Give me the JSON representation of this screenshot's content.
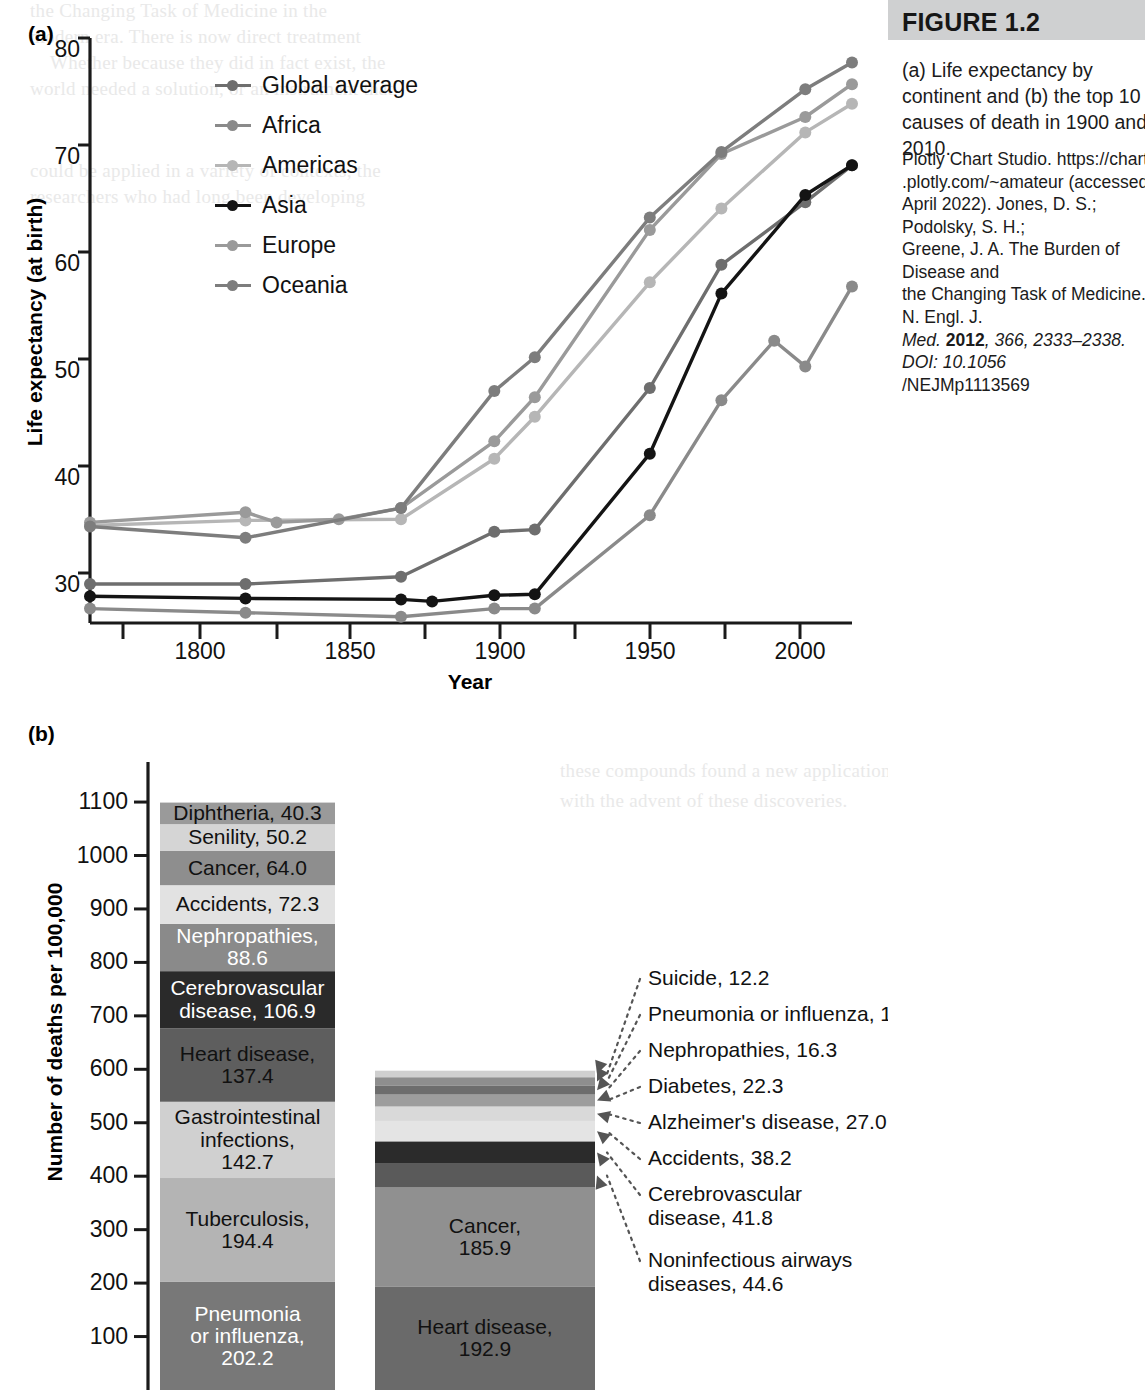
{
  "sidebar": {
    "figure_label": "FIGURE 1.2",
    "caption": "(a) Life expectancy by continent and (b) the top 10 causes of death in 1900 and 2010.",
    "source_line1": "Plotly Chart Studio. https://chart",
    "source_line2": ".plotly.com/~amateur (accessed",
    "source_line3": "April 2022). Jones, D. S.; Podolsky, S. H.;",
    "source_line4": "Greene, J. A. The Burden of Disease and",
    "source_line5": "the Changing Task of Medicine. N. Engl. J.",
    "source_line6_italic": "Med.",
    "source_line6_year": "2012",
    "source_line6_rest": ", 366, 2333–2338. DOI: 10.1056",
    "source_line7": "/NEJMp1113569"
  },
  "panel_a": {
    "tag": "(a)",
    "ylabel": "Life expectancy (at birth)",
    "xlabel": "Year",
    "yticks": [
      "80",
      "70",
      "60",
      "50",
      "40",
      "30"
    ],
    "xticks": [
      "1800",
      "1850",
      "1900",
      "1950",
      "2000"
    ],
    "legend": [
      {
        "label": "Global average",
        "color": "#6e6e6e"
      },
      {
        "label": "Africa",
        "color": "#8a8a8a"
      },
      {
        "label": "Americas",
        "color": "#b6b6b6"
      },
      {
        "label": "Asia",
        "color": "#141414"
      },
      {
        "label": "Europe",
        "color": "#9a9a9a"
      },
      {
        "label": "Oceania",
        "color": "#7d7d7d"
      }
    ]
  },
  "panel_b": {
    "tag": "(b)",
    "ylabel": "Number of deaths per 100,000",
    "yticks": [
      "1100",
      "1000",
      "900",
      "800",
      "700",
      "600",
      "500",
      "400",
      "300",
      "200",
      "100"
    ],
    "bar1900_segments": [
      {
        "label": "Diphtheria, 40.3",
        "value": 40.3,
        "color": "#9a9a9a",
        "text_color": "#111111"
      },
      {
        "label": "Senility, 50.2",
        "value": 50.2,
        "color": "#d5d5d5",
        "text_color": "#111111"
      },
      {
        "label": "Cancer, 64.0",
        "value": 64.0,
        "color": "#8e8e8e",
        "text_color": "#111111"
      },
      {
        "label": "Accidents, 72.3",
        "value": 72.3,
        "color": "#e2e2e2",
        "text_color": "#111111"
      },
      {
        "label": "Nephropathies, 88.6",
        "value": 88.6,
        "color": "#8a8a8a",
        "text_color": "#ffffff"
      },
      {
        "label": "Cerebrovascular\ndisease, 106.9",
        "value": 106.9,
        "color": "#2a2a2a",
        "text_color": "#ffffff"
      },
      {
        "label": "Heart disease,\n137.4",
        "value": 137.4,
        "color": "#5e5e5e",
        "text_color": "#111111"
      },
      {
        "label": "Gastrointestinal\ninfections,\n142.7",
        "value": 142.7,
        "color": "#d0d0d0",
        "text_color": "#111111"
      },
      {
        "label": "Tuberculosis,\n194.4",
        "value": 194.4,
        "color": "#b4b4b4",
        "text_color": "#111111"
      },
      {
        "label": "Pneumonia\nor influenza,\n202.2",
        "value": 202.2,
        "color": "#787878",
        "text_color": "#ffffff"
      }
    ],
    "bar2010_segments": [
      {
        "label": "Suicide, 12.2",
        "value": 12.2,
        "color": "#cfcfcf"
      },
      {
        "label": "Pneumonia or influenza, 16.2",
        "value": 16.2,
        "color": "#8e8e8e"
      },
      {
        "label": "Nephropathies, 16.3",
        "value": 16.3,
        "color": "#6d6d6d"
      },
      {
        "label": "Diabetes, 22.3",
        "value": 22.3,
        "color": "#9d9d9d"
      },
      {
        "label": "Alzheimer's disease, 27.0",
        "value": 27.0,
        "color": "#d9d9d9"
      },
      {
        "label": "Accidents, 38.2",
        "value": 38.2,
        "color": "#e4e4e4"
      },
      {
        "label": "Cerebrovascular\ndisease, 41.8",
        "value": 41.8,
        "color": "#2b2b2b"
      },
      {
        "label": "Noninfectious airways\ndiseases, 44.6",
        "value": 44.6,
        "color": "#5a5a5a"
      },
      {
        "label": "Cancer,\n185.9",
        "value": 185.9,
        "color": "#909090",
        "text_color": "#111111"
      },
      {
        "label": "Heart disease,\n192.9",
        "value": 192.9,
        "color": "#6a6a6a",
        "text_color": "#111111"
      }
    ]
  },
  "chart_data": [
    {
      "type": "line",
      "title": "(a) Life expectancy by continent",
      "xlabel": "Year",
      "ylabel": "Life expectancy (at birth)",
      "xlim": [
        1770,
        2015
      ],
      "ylim": [
        25,
        82
      ],
      "xticks": [
        1800,
        1850,
        1900,
        1950,
        2000
      ],
      "yticks": [
        30,
        40,
        50,
        60,
        70,
        80
      ],
      "grid": false,
      "legend_position": "top-left-inside",
      "series": [
        {
          "name": "Global average",
          "color": "#6e6e6e",
          "x": [
            1770,
            1820,
            1870,
            1900,
            1913,
            1950,
            1973,
            2000,
            2015
          ],
          "y": [
            28.8,
            28.8,
            29.5,
            33.9,
            34.1,
            47.9,
            59.9,
            66.0,
            69.6
          ]
        },
        {
          "name": "Africa",
          "color": "#8a8a8a",
          "x": [
            1770,
            1820,
            1870,
            1900,
            1913,
            1950,
            1973,
            1990,
            2000,
            2015
          ],
          "y": [
            26.4,
            26.0,
            25.6,
            26.4,
            26.4,
            35.5,
            46.7,
            52.5,
            50.0,
            57.8
          ]
        },
        {
          "name": "Americas",
          "color": "#b6b6b6",
          "x": [
            1770,
            1820,
            1870,
            1900,
            1913,
            1950,
            1973,
            2000,
            2015
          ],
          "y": [
            34.5,
            35.0,
            35.1,
            41.0,
            45.1,
            58.2,
            65.4,
            72.8,
            75.6
          ]
        },
        {
          "name": "Asia",
          "color": "#141414",
          "x": [
            1770,
            1820,
            1870,
            1880,
            1900,
            1913,
            1950,
            1973,
            2000,
            2015
          ],
          "y": [
            27.6,
            27.4,
            27.3,
            27.1,
            27.7,
            27.8,
            41.5,
            57.1,
            66.7,
            69.6
          ]
        },
        {
          "name": "Europe",
          "color": "#9a9a9a",
          "x": [
            1770,
            1820,
            1830,
            1850,
            1870,
            1900,
            1913,
            1950,
            1973,
            2000,
            2015
          ],
          "y": [
            34.8,
            35.8,
            34.8,
            35.1,
            36.2,
            42.7,
            47.0,
            63.3,
            70.7,
            74.3,
            77.5
          ]
        },
        {
          "name": "Oceania",
          "color": "#7d7d7d",
          "x": [
            1770,
            1820,
            1870,
            1900,
            1913,
            1950,
            1973,
            2000,
            2015
          ],
          "y": [
            34.4,
            33.3,
            36.2,
            47.6,
            50.9,
            64.5,
            70.9,
            77.0,
            79.6
          ]
        }
      ]
    },
    {
      "type": "bar",
      "title": "(b) Top 10 causes of death in 1900 and 2010",
      "ylabel": "Number of deaths per 100,000",
      "ylim": [
        0,
        1130
      ],
      "yticks": [
        100,
        200,
        300,
        400,
        500,
        600,
        700,
        800,
        900,
        1000,
        1100
      ],
      "stacked": true,
      "categories": [
        "1900",
        "2010"
      ],
      "series": [
        {
          "name": "1900",
          "total": 1099.1,
          "segments": [
            {
              "label": "Pneumonia or influenza",
              "value": 202.2
            },
            {
              "label": "Tuberculosis",
              "value": 194.4
            },
            {
              "label": "Gastrointestinal infections",
              "value": 142.7
            },
            {
              "label": "Heart disease",
              "value": 137.4
            },
            {
              "label": "Cerebrovascular disease",
              "value": 106.9
            },
            {
              "label": "Nephropathies",
              "value": 88.6
            },
            {
              "label": "Accidents",
              "value": 72.3
            },
            {
              "label": "Cancer",
              "value": 64.0
            },
            {
              "label": "Senility",
              "value": 50.2
            },
            {
              "label": "Diphtheria",
              "value": 40.3
            }
          ]
        },
        {
          "name": "2010",
          "total": 597.5,
          "segments": [
            {
              "label": "Heart disease",
              "value": 192.9
            },
            {
              "label": "Cancer",
              "value": 185.9
            },
            {
              "label": "Noninfectious airways diseases",
              "value": 44.6
            },
            {
              "label": "Cerebrovascular disease",
              "value": 41.8
            },
            {
              "label": "Accidents",
              "value": 38.2
            },
            {
              "label": "Alzheimer's disease",
              "value": 27.0
            },
            {
              "label": "Diabetes",
              "value": 22.3
            },
            {
              "label": "Nephropathies",
              "value": 16.3
            },
            {
              "label": "Pneumonia or influenza",
              "value": 16.2
            },
            {
              "label": "Suicide",
              "value": 12.2
            }
          ]
        }
      ]
    }
  ],
  "ghost_text": [
    "the Changing Task of Medicine in the",
    "modern era. There is now direct treatment",
    "Whether because they did in fact exist, the",
    "world needed a solution, or an instrument that",
    "could be applied in a variety of contexts, the",
    "researchers who had long been developing",
    "these compounds found a new application",
    "with the advent of these discoveries."
  ]
}
